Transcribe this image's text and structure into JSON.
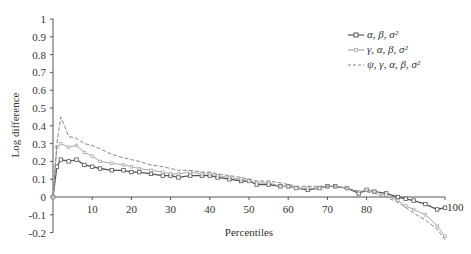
{
  "chart_data": {
    "type": "line",
    "title": "",
    "xlabel": "Percentiles",
    "ylabel": "Log difference",
    "xlim": [
      0,
      100
    ],
    "ylim": [
      -0.2,
      1
    ],
    "x_ticks": [
      "10",
      "20",
      "30",
      "40",
      "50",
      "60",
      "70",
      "80",
      "100"
    ],
    "y_ticks": [
      "1",
      "0.9",
      "0.8",
      "0.7",
      "0.6",
      "0.5",
      "0.4",
      "0.3",
      "0.2",
      "0.1",
      "0",
      "-0.1",
      "-0.2"
    ],
    "grid": false,
    "legend_position": "upper right",
    "x": [
      0,
      1,
      2,
      4,
      6,
      8,
      10,
      12,
      15,
      18,
      20,
      22,
      25,
      28,
      30,
      32,
      35,
      38,
      40,
      42,
      45,
      48,
      50,
      52,
      55,
      58,
      60,
      62,
      65,
      68,
      70,
      72,
      75,
      78,
      80,
      82,
      85,
      88,
      90,
      92,
      95,
      98,
      100
    ],
    "series": [
      {
        "name": "α, β, σ²",
        "color": "#555555",
        "style": "solid-square-markers",
        "values": [
          0,
          0.17,
          0.21,
          0.2,
          0.21,
          0.18,
          0.17,
          0.16,
          0.15,
          0.15,
          0.14,
          0.14,
          0.13,
          0.12,
          0.12,
          0.11,
          0.12,
          0.12,
          0.12,
          0.11,
          0.1,
          0.09,
          0.09,
          0.07,
          0.07,
          0.06,
          0.06,
          0.05,
          0.04,
          0.05,
          0.06,
          0.06,
          0.05,
          0.02,
          0.04,
          0.03,
          0.02,
          0.0,
          -0.01,
          -0.02,
          -0.04,
          -0.07,
          -0.06
        ]
      },
      {
        "name": "γ, α, β, σ²",
        "color": "#aaaaaa",
        "style": "solid-light",
        "values": [
          0,
          0.28,
          0.3,
          0.28,
          0.29,
          0.25,
          0.23,
          0.2,
          0.19,
          0.18,
          0.17,
          0.16,
          0.15,
          0.14,
          0.13,
          0.13,
          0.14,
          0.13,
          0.13,
          0.12,
          0.11,
          0.1,
          0.09,
          0.08,
          0.08,
          0.06,
          0.06,
          0.05,
          0.05,
          0.05,
          0.06,
          0.06,
          0.05,
          0.03,
          0.04,
          0.03,
          0.01,
          -0.02,
          -0.05,
          -0.07,
          -0.1,
          -0.16,
          -0.22
        ]
      },
      {
        "name": "ψ, γ, α, β, σ²",
        "color": "#888888",
        "style": "dashed",
        "values": [
          0,
          0.3,
          0.45,
          0.34,
          0.33,
          0.3,
          0.29,
          0.27,
          0.24,
          0.22,
          0.21,
          0.2,
          0.18,
          0.17,
          0.16,
          0.15,
          0.15,
          0.14,
          0.14,
          0.13,
          0.12,
          0.11,
          0.1,
          0.09,
          0.09,
          0.08,
          0.07,
          0.06,
          0.06,
          0.06,
          0.06,
          0.06,
          0.05,
          0.03,
          0.03,
          0.02,
          0.0,
          -0.03,
          -0.06,
          -0.09,
          -0.13,
          -0.18,
          -0.24
        ]
      }
    ]
  },
  "legend": {
    "items": [
      {
        "label": "α, β, σ²"
      },
      {
        "label": "γ, α, β, σ²"
      },
      {
        "label": "ψ, γ, α, β, σ²"
      }
    ]
  }
}
